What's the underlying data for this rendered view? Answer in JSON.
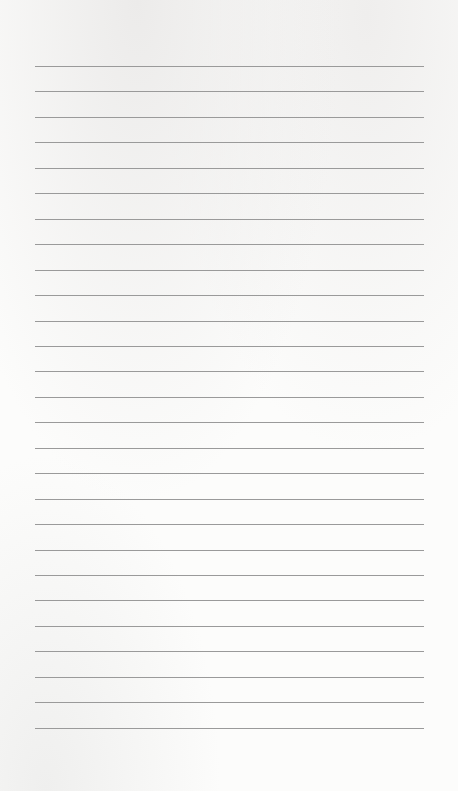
{
  "page": {
    "type": "lined-paper",
    "line_count": 27,
    "first_line_y": 66,
    "line_spacing": 25.45,
    "line_left": 35,
    "line_width": 389,
    "line_color": "#9a9a9a",
    "paper_color": "#fcfcfb"
  }
}
